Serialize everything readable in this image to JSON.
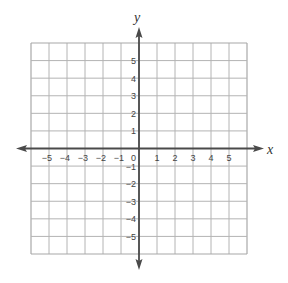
{
  "chart_data": {
    "type": "coordinate-grid",
    "title": "",
    "xlabel": "x",
    "ylabel": "y",
    "xlim": [
      -6,
      6
    ],
    "ylim": [
      -6,
      6
    ],
    "grid": true,
    "x_ticks": [
      -5,
      -4,
      -3,
      -2,
      -1,
      1,
      2,
      3,
      4,
      5
    ],
    "y_ticks": [
      -5,
      -4,
      -3,
      -2,
      -1,
      1,
      2,
      3,
      4,
      5
    ],
    "x_tick_labels": [
      "−5",
      "−4",
      "−3",
      "−2",
      "−1",
      "1",
      "2",
      "3",
      "4",
      "5"
    ],
    "y_tick_labels": [
      "−5",
      "−4",
      "−3",
      "−2",
      "−1",
      "1",
      "2",
      "3",
      "4",
      "5"
    ],
    "origin_label": "0",
    "series": []
  },
  "colors": {
    "grid": "#b4b4b4",
    "axis": "#4a4a4a",
    "label": "#444444"
  }
}
